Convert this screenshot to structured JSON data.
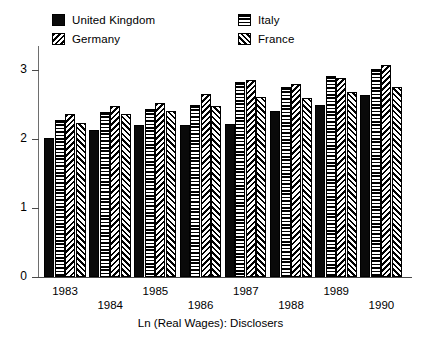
{
  "chart_data": {
    "type": "bar",
    "title": "",
    "xlabel": "Ln (Real Wages): Disclosers",
    "ylabel": "",
    "categories": [
      "1983",
      "1984",
      "1985",
      "1986",
      "1987",
      "1988",
      "1989",
      "1990"
    ],
    "series": [
      {
        "name": "United Kingdom",
        "pattern": "solid",
        "values": [
          2.01,
          2.13,
          2.2,
          2.2,
          2.22,
          2.41,
          2.5,
          2.64
        ]
      },
      {
        "name": "Italy",
        "pattern": "horizontal",
        "values": [
          2.27,
          2.39,
          2.44,
          2.5,
          2.83,
          2.76,
          2.92,
          3.01
        ]
      },
      {
        "name": "Germany",
        "pattern": "backslash",
        "values": [
          2.36,
          2.48,
          2.53,
          2.66,
          2.85,
          2.8,
          2.88,
          3.07
        ]
      },
      {
        "name": "France",
        "pattern": "slash",
        "values": [
          2.23,
          2.36,
          2.41,
          2.48,
          2.61,
          2.59,
          2.68,
          2.75
        ]
      }
    ],
    "ylim": [
      0,
      3.35
    ],
    "yticks": [
      0,
      1,
      2,
      3
    ],
    "ytick_labels": [
      "0",
      "1",
      "2",
      "3"
    ],
    "grid": false,
    "legend_position": "top",
    "legend": [
      "United Kingdom",
      "Germany",
      "Italy",
      "France"
    ],
    "colors": {
      "ink": "#000000",
      "axis": "#4a4a4a",
      "background": "#ffffff"
    }
  },
  "legend": {
    "items": [
      {
        "label": "United Kingdom",
        "swatch": "solid-swatch-icon"
      },
      {
        "label": "Germany",
        "swatch": "backslash-hatch-swatch-icon"
      },
      {
        "label": "Italy",
        "swatch": "horizontal-hatch-swatch-icon"
      },
      {
        "label": "France",
        "swatch": "slash-hatch-swatch-icon"
      }
    ]
  },
  "axis": {
    "x_title": "Ln (Real Wages): Disclosers"
  }
}
